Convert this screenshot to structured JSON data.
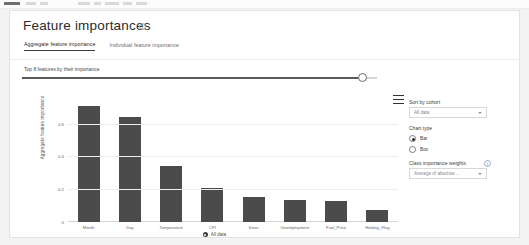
{
  "header": {
    "title": "Feature importances",
    "info_icon": "info-circle-icon"
  },
  "tabs": [
    {
      "label": "Aggregate feature importance",
      "active": true
    },
    {
      "label": "Individual feature importance",
      "active": false
    }
  ],
  "slider": {
    "label": "Top 8 features by their importance",
    "value": 8,
    "fill_percent": 95
  },
  "chart_menu_icon": "hamburger-menu-icon",
  "chart_data": {
    "type": "bar",
    "title": "",
    "xlabel": "",
    "ylabel": "Aggregate feature importance",
    "categories": [
      "Month",
      "Day",
      "Temperature",
      "CPI",
      "Store",
      "Unemployment",
      "Fuel_Price",
      "Holiday_Flag"
    ],
    "values": [
      0.71,
      0.64,
      0.34,
      0.21,
      0.15,
      0.135,
      0.13,
      0.075
    ],
    "yticks": [
      "0",
      "0.2",
      "0.4",
      "0.6"
    ],
    "ytick_values": [
      0,
      0.2,
      0.4,
      0.6
    ],
    "ylim": [
      0,
      0.75
    ],
    "grid": true,
    "bar_color": "#4b4b4b",
    "legend": {
      "position": "bottom",
      "entries": [
        "All data"
      ]
    }
  },
  "legend": {
    "text": "All data",
    "marker": "filled-circle-marker"
  },
  "panel": {
    "sort_by_cohort": {
      "label": "Sort by cohort",
      "value": "All data",
      "caret": "chevron-down-icon"
    },
    "chart_type": {
      "label": "Chart type",
      "options": [
        {
          "label": "Bar",
          "selected": true
        },
        {
          "label": "Box",
          "selected": false
        }
      ]
    },
    "class_importance_weights": {
      "label": "Class importance weights",
      "info_icon": "info-circle-icon",
      "value": "Average of absolute ...",
      "caret": "chevron-down-icon"
    }
  }
}
